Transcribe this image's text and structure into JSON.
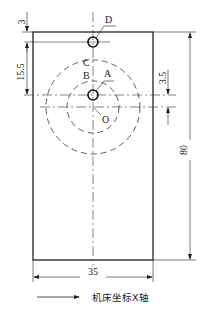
{
  "diagram": {
    "type": "engineering-drawing",
    "colors": {
      "line": "#222222",
      "background": "#ffffff"
    },
    "part": {
      "shape": "rectangle",
      "width_mm": 35,
      "height_mm": 80
    },
    "points": {
      "A": "A",
      "B": "B",
      "C": "C",
      "D": "D",
      "O": "O"
    },
    "dimensions": {
      "top_offset": "3",
      "hole_spacing": "15.5",
      "center_offset": "3.5",
      "height": "80",
      "width": "35"
    },
    "legend": {
      "arrow": "right-arrow",
      "text": "机床坐标X轴"
    }
  }
}
